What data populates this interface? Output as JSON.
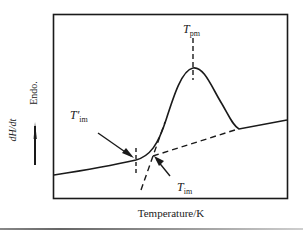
{
  "diagram": {
    "type": "DSC thermogram schematic",
    "y_axis": {
      "label": "dH/dt",
      "direction_label": "Endo.",
      "arrow": "up"
    },
    "x_axis": {
      "label": "Temperature/K"
    },
    "annotations": [
      {
        "id": "t_pm",
        "symbol": "T",
        "subscript": "pm",
        "meaning": "peak melting temperature"
      },
      {
        "id": "t_im_prime",
        "symbol": "T′",
        "subscript": "im",
        "meaning": "initial melting temperature (onset, curve departure)"
      },
      {
        "id": "t_im",
        "symbol": "T",
        "subscript": "im",
        "meaning": "extrapolated onset melting temperature"
      }
    ],
    "colors": {
      "line": "#1a1a1a",
      "background": "#ffffff"
    }
  },
  "labels": {
    "y_label": "dH/dt",
    "endo_label": "Endo.",
    "x_label": "Temperature/K",
    "t_pm_main": "T",
    "t_pm_sub": "pm",
    "t_im_prime_main": "T′",
    "t_im_prime_sub": "im",
    "t_im_main": "T",
    "t_im_sub": "im"
  }
}
